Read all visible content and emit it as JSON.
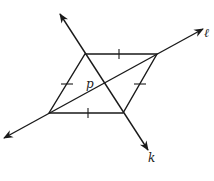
{
  "diagram": {
    "labels": {
      "line_l": "ℓ",
      "line_k": "k",
      "intersection": "p"
    },
    "shape": "rhombus",
    "vertices": {
      "top_left": [
        85,
        54
      ],
      "top_right": [
        157,
        54
      ],
      "bottom_right": [
        123,
        113
      ],
      "bottom_left": [
        49,
        113
      ]
    },
    "lines": {
      "k": {
        "from": [
          60,
          14
        ],
        "to": [
          148,
          150
        ],
        "arrows": "both"
      },
      "l": {
        "from": [
          4,
          138
        ],
        "to": [
          203,
          29
        ],
        "arrows": "both"
      }
    },
    "congruence_marks": 4,
    "stroke_color": "#1a1a1a"
  }
}
